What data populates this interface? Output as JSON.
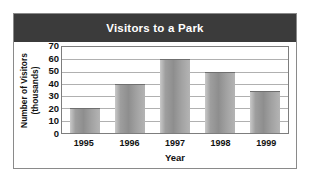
{
  "chart_data": {
    "type": "bar",
    "title": "Visitors to a Park",
    "xlabel": "Year",
    "ylabel": "Number of Visitors (thousands)",
    "ylabel_line1": "Number of Visitors",
    "ylabel_line2": "(thousands)",
    "categories": [
      "1995",
      "1996",
      "1997",
      "1998",
      "1999"
    ],
    "values": [
      20,
      40,
      60,
      50,
      34
    ],
    "yticks": [
      0,
      10,
      20,
      30,
      40,
      50,
      60,
      70
    ],
    "ylim": [
      0,
      70
    ],
    "grid": true,
    "legend": false,
    "series_name": "Visitors",
    "bar_color": "#9e9e9e",
    "title_band_color": "#3b3b3b",
    "title_text_color": "#ffffff"
  }
}
